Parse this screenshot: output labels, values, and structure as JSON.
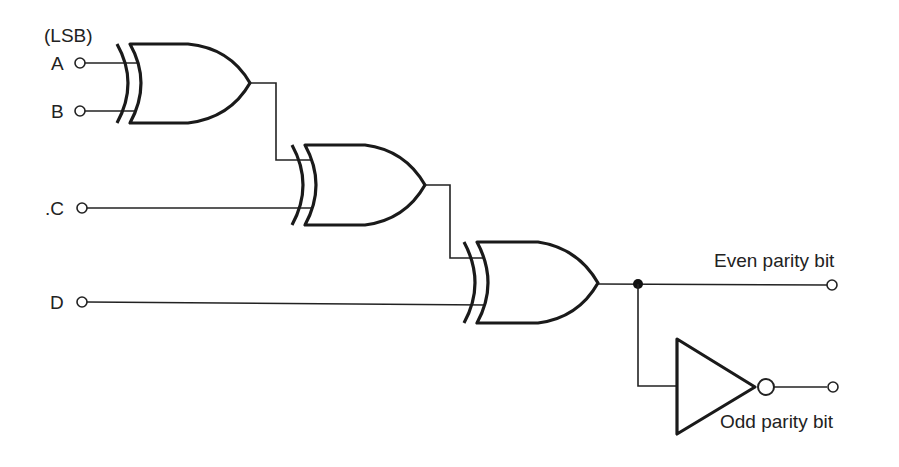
{
  "diagram": {
    "labels": {
      "lsb": "(LSB)",
      "input_a": "A",
      "input_b": "B",
      "input_c": ".C",
      "input_d": "D",
      "even_output": "Even parity bit",
      "odd_output": "Odd parity bit"
    },
    "gates": [
      {
        "id": "xor1",
        "type": "XOR",
        "inputs": [
          "A",
          "B"
        ]
      },
      {
        "id": "xor2",
        "type": "XOR",
        "inputs": [
          "xor1",
          "C"
        ]
      },
      {
        "id": "xor3",
        "type": "XOR",
        "inputs": [
          "xor2",
          "D"
        ]
      },
      {
        "id": "not1",
        "type": "NOT",
        "inputs": [
          "xor3"
        ]
      }
    ],
    "outputs": [
      {
        "name": "Even parity bit",
        "source": "xor3"
      },
      {
        "name": "Odd parity bit",
        "source": "not1"
      }
    ],
    "colors": {
      "line": "#1a1a1a",
      "background": "#ffffff"
    }
  }
}
